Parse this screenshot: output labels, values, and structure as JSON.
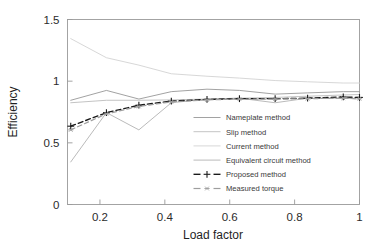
{
  "chart_data": {
    "type": "line",
    "title": "",
    "xlabel": "Load factor",
    "ylabel": "Efficiency",
    "xlim": [
      0.1,
      1.0
    ],
    "ylim": [
      0.0,
      1.5
    ],
    "xticks": [
      0.2,
      0.4,
      0.6,
      0.8,
      1
    ],
    "xtick_labels": [
      "0.2",
      "0.4",
      "0.6",
      "0.8",
      "1"
    ],
    "yticks": [
      0,
      0.5,
      1,
      1.5
    ],
    "ytick_labels": [
      "0",
      "0.5",
      "1",
      "1.5"
    ],
    "grid": false,
    "legend_position": "center-right-inside",
    "series": [
      {
        "name": "Nameplate method",
        "color": "#8a8a8a",
        "style": "solid",
        "width": 0.8,
        "marker": "none",
        "x": [
          0.11,
          0.22,
          0.32,
          0.42,
          0.53,
          0.63,
          0.74,
          0.84,
          0.95,
          1.0
        ],
        "y": [
          0.845,
          0.925,
          0.855,
          0.915,
          0.935,
          0.925,
          0.895,
          0.905,
          0.915,
          0.915
        ]
      },
      {
        "name": "Slip method",
        "color": "#b4b4b4",
        "style": "solid",
        "width": 0.8,
        "marker": "none",
        "x": [
          0.11,
          0.22,
          0.32,
          0.42,
          0.53,
          0.63,
          0.74,
          0.84,
          0.95,
          1.0
        ],
        "y": [
          0.825,
          0.845,
          0.845,
          0.848,
          0.855,
          0.862,
          0.868,
          0.878,
          0.888,
          0.892
        ]
      },
      {
        "name": "Current method",
        "color": "#d2d2d2",
        "style": "solid",
        "width": 0.9,
        "marker": "none",
        "x": [
          0.11,
          0.22,
          0.32,
          0.42,
          0.53,
          0.63,
          0.74,
          0.84,
          0.95,
          1.0
        ],
        "y": [
          1.345,
          1.19,
          1.13,
          1.06,
          1.04,
          1.025,
          1.005,
          0.995,
          0.985,
          0.985
        ]
      },
      {
        "name": "Equivalent circuit method",
        "color": "#a8a8a8",
        "style": "solid",
        "width": 0.8,
        "marker": "none",
        "x": [
          0.11,
          0.22,
          0.32,
          0.42,
          0.53,
          0.63,
          0.74,
          0.84,
          0.95,
          1.0
        ],
        "y": [
          0.345,
          0.745,
          0.605,
          0.825,
          0.855,
          0.862,
          0.825,
          0.862,
          0.862,
          0.855
        ]
      },
      {
        "name": "Proposed method",
        "color": "#1a1a1a",
        "style": "dashed",
        "width": 1.35,
        "marker": "plus",
        "x": [
          0.11,
          0.22,
          0.32,
          0.42,
          0.53,
          0.63,
          0.74,
          0.84,
          0.95,
          1.0
        ],
        "y": [
          0.635,
          0.745,
          0.805,
          0.838,
          0.852,
          0.858,
          0.858,
          0.862,
          0.872,
          0.868
        ]
      },
      {
        "name": "Measured torque",
        "color": "#9e9e9e",
        "style": "dashed",
        "width": 1.2,
        "marker": "star",
        "x": [
          0.11,
          0.22,
          0.32,
          0.42,
          0.53,
          0.63,
          0.74,
          0.84,
          0.95,
          1.0
        ],
        "y": [
          0.605,
          0.735,
          0.795,
          0.832,
          0.848,
          0.855,
          0.855,
          0.858,
          0.862,
          0.858
        ]
      }
    ]
  },
  "axes": {
    "frame_color": "#9a9a9a"
  },
  "legend": {
    "entries": [
      {
        "label": "Nameplate method"
      },
      {
        "label": "Slip method"
      },
      {
        "label": "Current method"
      },
      {
        "label": "Equivalent circuit method"
      },
      {
        "label": "Proposed method"
      },
      {
        "label": "Measured torque"
      }
    ]
  }
}
